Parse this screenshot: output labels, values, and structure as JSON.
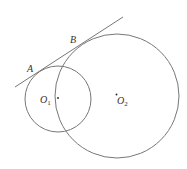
{
  "diagram": {
    "stroke_color": "#777777",
    "points": {
      "A": {
        "label": "A"
      },
      "B": {
        "label": "B"
      },
      "O1": {
        "label": "O",
        "subscript": "1"
      },
      "O2": {
        "label": "O",
        "subscript": "2"
      }
    },
    "circles": [
      {
        "name": "circle-O1",
        "cx": 58,
        "cy": 99,
        "r": 33
      },
      {
        "name": "circle-O2",
        "cx": 117,
        "cy": 96,
        "r": 62
      }
    ],
    "tangent_line": {
      "x1": 15,
      "y1": 87,
      "x2": 123,
      "y2": 17
    }
  }
}
